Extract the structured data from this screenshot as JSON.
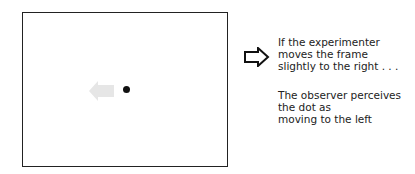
{
  "diagram": {
    "frame": {
      "label": "frame"
    },
    "dot": {
      "label": "dot"
    },
    "perceived_motion_arrow": {
      "direction": "left",
      "color": "#e6e6e6"
    },
    "frame_motion_arrow": {
      "direction": "right",
      "style": "outline"
    },
    "captions": {
      "action": "If the experimenter\nmoves the frame\nslightly to the right . . .",
      "perception": "The observer perceives\nthe dot as\nmoving to the left"
    }
  }
}
